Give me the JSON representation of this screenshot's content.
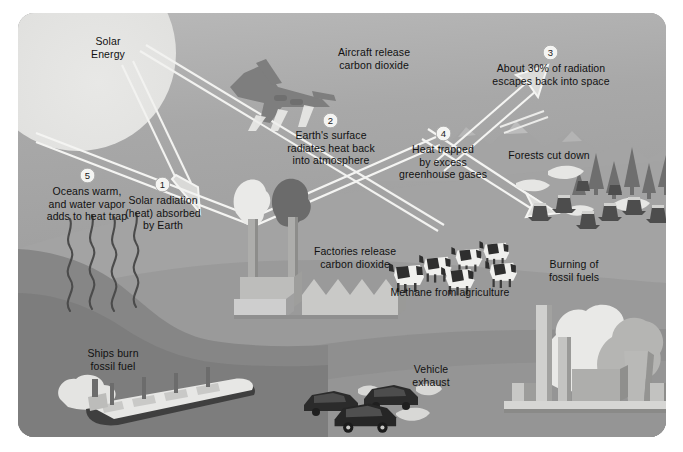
{
  "diagram": {
    "panel": {
      "corner_radius_px": 16,
      "background_color": "#9d9d9d",
      "sky_color": "#b0b0b0",
      "ocean_color": "#8a8a8a",
      "land_color": "#a6a6a6"
    },
    "sun_label": "Solar\nEnergy",
    "sun": {
      "line1": "Solar",
      "line2": "Energy"
    },
    "steps": [
      {
        "number": "1",
        "text_lines": [
          "Solar radiation",
          "(heat) absorbed",
          "by Earth"
        ],
        "text": "Solar radiation (heat) absorbed by Earth"
      },
      {
        "number": "2",
        "text_lines": [
          "Earth's surface",
          "radiates heat back",
          "into atmosphere"
        ],
        "text": "Earth's surface radiates heat back into atmosphere"
      },
      {
        "number": "3",
        "text_lines": [
          "About 30% of radiation",
          "escapes back into space"
        ],
        "text": "About 30% of radiation escapes back into space"
      },
      {
        "number": "4",
        "text_lines": [
          "Heat trapped",
          "by excess",
          "greenhouse gases"
        ],
        "text": "Heat trapped by excess greenhouse gases"
      },
      {
        "number": "5",
        "text_lines": [
          "Oceans warm,",
          "and water vapor",
          "adds to heat trap"
        ],
        "text": "Oceans warm, and water vapor adds to heat trap"
      }
    ],
    "captions": [
      {
        "id": "aircraft",
        "lines": [
          "Aircraft release",
          "carbon dioxide"
        ],
        "text": "Aircraft release carbon dioxide"
      },
      {
        "id": "factories",
        "lines": [
          "Factories release",
          "carbon dioxide"
        ],
        "text": "Factories release carbon dioxide"
      },
      {
        "id": "forests",
        "lines": [
          "Forests cut down"
        ],
        "text": "Forests cut down"
      },
      {
        "id": "methane",
        "lines": [
          "Methane from agriculture"
        ],
        "text": "Methane from agriculture"
      },
      {
        "id": "burning",
        "lines": [
          "Burning of",
          "fossil fuels"
        ],
        "text": "Burning of fossil fuels"
      },
      {
        "id": "ships",
        "lines": [
          "Ships burn",
          "fossil fuel"
        ],
        "text": "Ships burn fossil fuel"
      },
      {
        "id": "vehicles",
        "lines": [
          "Vehicle",
          "exhaust"
        ],
        "text": "Vehicle exhaust"
      }
    ],
    "objects": [
      {
        "name": "sun",
        "label": "sun"
      },
      {
        "name": "airplane",
        "label": "aircraft with contrails"
      },
      {
        "name": "factory",
        "label": "factory with two smokestacks"
      },
      {
        "name": "cows",
        "label": "herd of six cows"
      },
      {
        "name": "tree-stumps",
        "label": "cut tree stumps and conifers"
      },
      {
        "name": "power-plant",
        "label": "industrial plant with smoke plumes"
      },
      {
        "name": "cargo-ship",
        "label": "cargo ship with smoke"
      },
      {
        "name": "cars",
        "label": "three cars with exhaust"
      },
      {
        "name": "water-vapor",
        "label": "four wavy vapor lines"
      }
    ]
  }
}
